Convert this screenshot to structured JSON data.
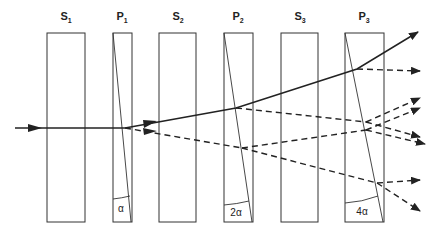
{
  "diagram": {
    "elements": [
      {
        "id": "S1",
        "name": "S",
        "sub": "1",
        "type": "plate",
        "x": 47,
        "w": 38,
        "label_x": 66
      },
      {
        "id": "P1",
        "name": "P",
        "sub": "1",
        "type": "prism",
        "x": 113,
        "w": 19,
        "label_x": 122,
        "angle": "α"
      },
      {
        "id": "S2",
        "name": "S",
        "sub": "2",
        "type": "plate",
        "x": 159,
        "w": 37,
        "label_x": 178
      },
      {
        "id": "P2",
        "name": "P",
        "sub": "2",
        "type": "prism",
        "x": 224,
        "w": 29,
        "label_x": 238,
        "angle": "2α"
      },
      {
        "id": "S3",
        "name": "S",
        "sub": "3",
        "type": "plate",
        "x": 281,
        "w": 37,
        "label_x": 300
      },
      {
        "id": "P3",
        "name": "P",
        "sub": "3",
        "type": "prism",
        "x": 345,
        "w": 39,
        "label_x": 364,
        "angle": "4α"
      }
    ],
    "box_top": 33,
    "box_bottom": 222,
    "colors": {
      "stroke": "#222222",
      "background": "#ffffff"
    },
    "rays": {
      "incoming": "solid",
      "undeflected_path": "solid",
      "split_paths": "dashed"
    }
  }
}
